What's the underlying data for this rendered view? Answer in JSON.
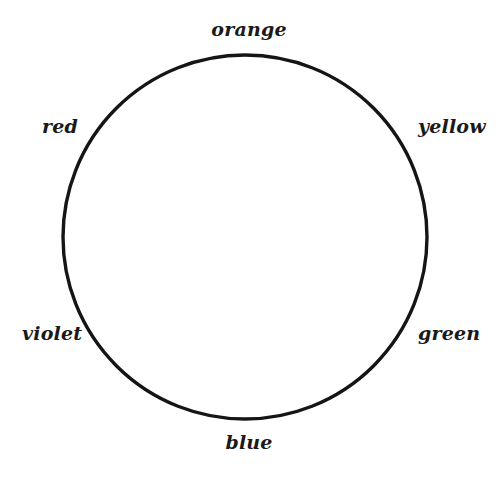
{
  "figure": {
    "kind": "color-wheel-diagram",
    "background_color": "#ffffff",
    "title": ""
  },
  "wheel": {
    "center_x": 245,
    "center_y": 237,
    "radius": 182,
    "outer_stroke_color": "#151515",
    "outer_stroke_width": 3.4,
    "divider_stroke_color": "#3f3f3f",
    "divider_stroke_width": 1.5,
    "sector_count": 6,
    "fill_color": "#ffffff"
  },
  "labels": {
    "orange": "orange",
    "yellow": "yellow",
    "green": "green",
    "blue": "blue",
    "violet": "violet",
    "red": "red"
  },
  "chart_data": {
    "type": "pie",
    "categories": [
      "orange",
      "yellow",
      "green",
      "blue",
      "violet",
      "red"
    ],
    "values": [
      1,
      1,
      1,
      1,
      1,
      1
    ],
    "slice_angles_deg": [
      60,
      60,
      60,
      60,
      60,
      60
    ],
    "label_positions": [
      "top",
      "upper-right",
      "lower-right",
      "bottom",
      "lower-left",
      "upper-left"
    ],
    "legend": "none",
    "grid": false
  }
}
